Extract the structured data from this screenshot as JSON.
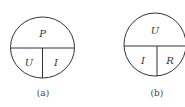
{
  "diagrams": [
    {
      "id": "a",
      "top_label": "P",
      "bottom_left_label": "U",
      "bottom_right_label": "I",
      "caption": "(a)"
    },
    {
      "id": "b",
      "top_label": "U",
      "bottom_left_label": "I",
      "bottom_right_label": "R",
      "caption": "(b)"
    }
  ],
  "colors": {
    "stroke": "#333333",
    "text": "#333333"
  }
}
